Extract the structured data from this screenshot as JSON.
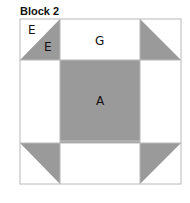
{
  "title": "Block 2",
  "colors": {
    "fill": "#9a9a9a",
    "line": "#b8b8b8",
    "background": "#ffffff"
  },
  "pieces": {
    "E_white": "E",
    "E_gray": "E",
    "G": "G",
    "A": "A"
  }
}
